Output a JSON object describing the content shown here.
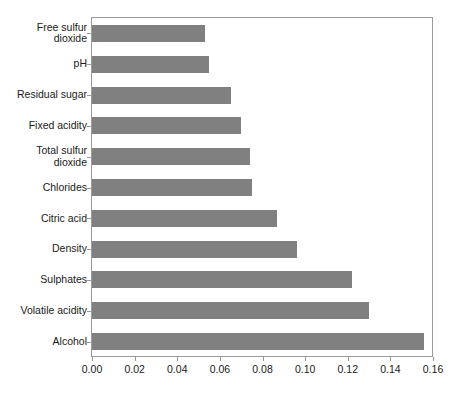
{
  "chart_data": {
    "type": "bar",
    "orientation": "horizontal",
    "title": "",
    "subtitle": "",
    "xlabel": "",
    "ylabel": "",
    "categories": [
      "Free sulfur\ndioxide",
      "pH",
      "Residual sugar",
      "Fixed acidity",
      "Total sulfur\ndioxide",
      "Chlorides",
      "Citric acid",
      "Density",
      "Sulphates",
      "Volatile acidity",
      "Alcohol"
    ],
    "values": [
      0.053,
      0.055,
      0.065,
      0.07,
      0.074,
      0.075,
      0.087,
      0.096,
      0.122,
      0.13,
      0.156
    ],
    "xlim": [
      0.0,
      0.16
    ],
    "xticks": [
      0.0,
      0.02,
      0.04,
      0.06,
      0.08,
      0.1,
      0.12,
      0.14,
      0.16
    ],
    "xticklabels": [
      "0.00",
      "0.02",
      "0.04",
      "0.06",
      "0.08",
      "0.10",
      "0.12",
      "0.14",
      "0.16"
    ],
    "grid": false,
    "legend": null,
    "bar_color": "#808080",
    "axis_color": "#9a9a9a",
    "text_color": "#1a1a1a",
    "background": "#ffffff"
  }
}
